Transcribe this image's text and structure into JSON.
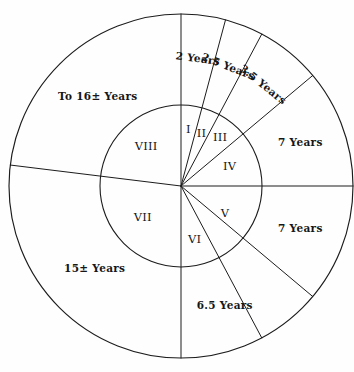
{
  "figure": {
    "background_color": "#fefefe",
    "line_color": "#1c1c1c",
    "text_color": "#161616"
  },
  "geometry": {
    "center_x": 181,
    "center_y": 186,
    "outer_radius": 172,
    "inner_radius": 81
  },
  "chart_data": {
    "type": "pie",
    "title": "",
    "xlabel": "",
    "ylabel": "",
    "legend_position": "none",
    "grid": false,
    "rings": [
      {
        "name": "inner",
        "radius_px": 81,
        "sectors": [
          {
            "label": "I",
            "start_deg": -90,
            "end_deg": -75,
            "label_deg": -82.5,
            "label_radius": 56
          },
          {
            "label": "II",
            "start_deg": -75,
            "end_deg": -62,
            "label_deg": -68.5,
            "label_radius": 56
          },
          {
            "label": "III",
            "start_deg": -62,
            "end_deg": -40,
            "label_deg": -51,
            "label_radius": 62
          },
          {
            "label": "IV",
            "start_deg": -40,
            "end_deg": 0,
            "label_deg": -21,
            "label_radius": 52
          },
          {
            "label": "V",
            "start_deg": 0,
            "end_deg": 62,
            "label_deg": 32,
            "label_radius": 52
          },
          {
            "label": "VI",
            "start_deg": 62,
            "end_deg": 90,
            "label_deg": 76,
            "label_radius": 56
          },
          {
            "label": "VII",
            "start_deg": 90,
            "end_deg": 187,
            "label_deg": 140,
            "label_radius": 50
          },
          {
            "label": "VIII",
            "start_deg": 187,
            "end_deg": 270,
            "label_deg": 228,
            "label_radius": 52
          }
        ]
      },
      {
        "name": "outer",
        "radius_px": 172,
        "sectors": [
          {
            "label": "2 Years",
            "start_deg": -90,
            "end_deg": -75,
            "label_deg": -82.5,
            "label_radius": 128,
            "rotated": true
          },
          {
            "label": "2.5 Years",
            "start_deg": -75,
            "end_deg": -62,
            "label_deg": -68.5,
            "label_radius": 128,
            "rotated": true
          },
          {
            "label": "3.5 Years",
            "start_deg": -62,
            "end_deg": -40,
            "label_deg": -51,
            "label_radius": 130,
            "rotated": true
          },
          {
            "label": "7 Years",
            "start_deg": -40,
            "end_deg": 0,
            "label_deg": -20,
            "label_radius": 127,
            "rotated": false
          },
          {
            "label": "7 Years",
            "start_deg": 0,
            "end_deg": 40,
            "label_deg": 20,
            "label_radius": 127,
            "rotated": false
          },
          {
            "label": "6.5 Years",
            "start_deg": 40,
            "end_deg": 90,
            "label_deg": 70,
            "label_radius": 128,
            "rotated": false
          },
          {
            "label": "15± Years",
            "start_deg": 90,
            "end_deg": 187,
            "label_deg": 136,
            "label_radius": 120,
            "rotated": false
          },
          {
            "label": "To 16± Years",
            "start_deg": 187,
            "end_deg": 270,
            "label_deg": 227,
            "label_radius": 122,
            "rotated": false
          }
        ]
      }
    ],
    "spoke_angles_deg": [
      -90,
      -75,
      -62,
      -40,
      0,
      40,
      62,
      90,
      187
    ],
    "inner_only_spoke_angles_deg": []
  },
  "labels": {
    "inner_roman": [
      "I",
      "II",
      "III",
      "IV",
      "V",
      "VI",
      "VII",
      "VIII"
    ],
    "outer_durations": [
      "2 Years",
      "2.5 Years",
      "3.5 Years",
      "7 Years",
      "7 Years",
      "6.5 Years",
      "15± Years",
      "To 16± Years"
    ]
  }
}
